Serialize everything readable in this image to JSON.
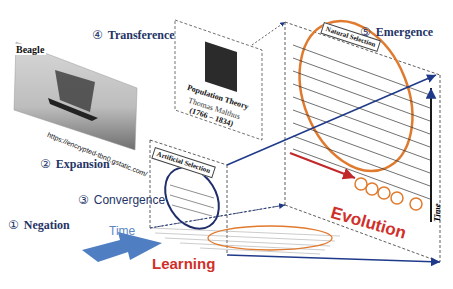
{
  "stages": [
    {
      "num": "①",
      "label": "Negation"
    },
    {
      "num": "②",
      "label": "Expansion"
    },
    {
      "num": "③",
      "label": "Convergence"
    },
    {
      "num": "④",
      "label": "Transference"
    },
    {
      "num": "⑤",
      "label": "Emergence"
    }
  ],
  "beagle": {
    "title": "Beagle",
    "url": "https://encrypted-tbn0.gstatic.com/"
  },
  "malthus": {
    "theory": "Population Theory",
    "name": "Thomas Malthus",
    "years": "(1766 – 1834)"
  },
  "panels": {
    "artificial": "Artificial Selection",
    "natural": "Natural Selection"
  },
  "axes": {
    "time_left": "Time",
    "time_right": "Time",
    "learning": "Learning",
    "evolution": "Evolution"
  },
  "species": [
    "A",
    "B",
    "C",
    "D",
    "E"
  ],
  "colors": {
    "navy": "#243466",
    "orange": "#e07a2e",
    "red": "#d0302a",
    "blue_arrow": "#5b87c5",
    "axis": "#1f3a8a"
  }
}
